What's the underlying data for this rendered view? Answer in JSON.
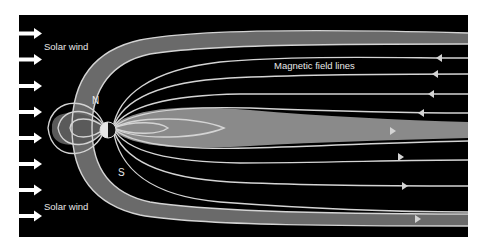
{
  "diagram": {
    "labels": {
      "solar_wind_top": "Solar wind",
      "solar_wind_bottom": "Solar wind",
      "field_lines": "Magnetic field lines",
      "north_pole": "N",
      "south_pole": "S"
    },
    "colors": {
      "background": "#000000",
      "page": "#ffffff",
      "field_line": "#d0d0d0",
      "sheath": "#6e6e6e",
      "plasma": "#8a8a8a",
      "arrow": "#ffffff",
      "earth_day": "#e6e6e6",
      "earth_night": "#111111"
    },
    "solar_wind_arrow_count": 8,
    "tail_arrows_incoming": 4,
    "tail_arrows_outgoing": 4
  }
}
